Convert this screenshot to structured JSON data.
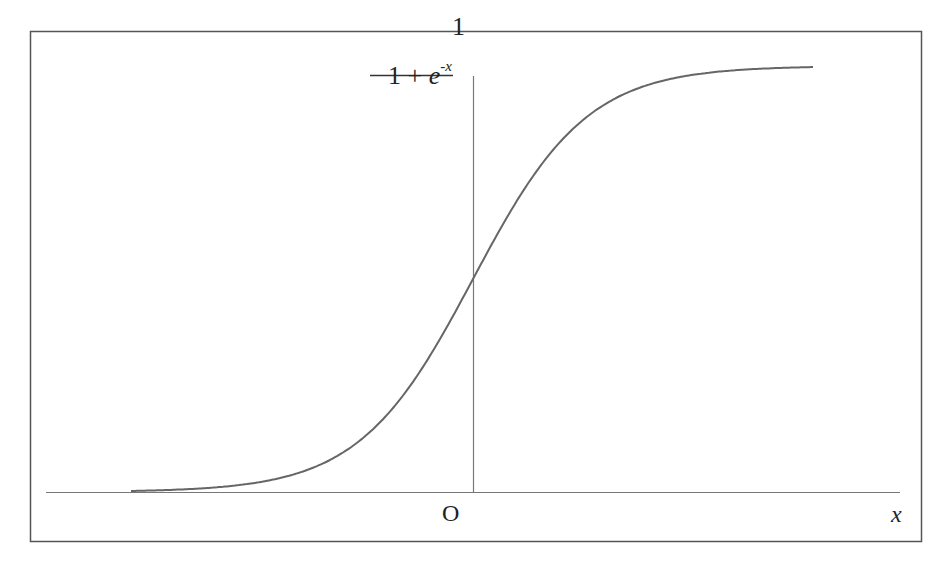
{
  "figure": {
    "frame_color": "#555555",
    "axis_color": "#777777",
    "curve_color": "#666666",
    "function_label": {
      "numerator": "1",
      "denominator_prefix": "1 + ",
      "denominator_base": "e",
      "denominator_exponent": "-x"
    },
    "origin_label": "O",
    "x_axis_label": "x"
  },
  "chart_data": {
    "type": "line",
    "title": "",
    "function": "1 / (1 + e^-x)",
    "xlabel": "x",
    "ylabel": "1 / (1 + e^-x)",
    "origin_label": "O",
    "xlim": [
      -6,
      6
    ],
    "ylim": [
      0,
      1
    ],
    "grid": false,
    "legend": null,
    "series": [
      {
        "name": "sigmoid",
        "x": [
          -6,
          -5,
          -4,
          -3,
          -2,
          -1,
          0,
          1,
          2,
          3,
          4,
          5,
          6
        ],
        "y": [
          0.0025,
          0.0067,
          0.018,
          0.047,
          0.119,
          0.269,
          0.5,
          0.731,
          0.881,
          0.953,
          0.982,
          0.993,
          0.9975
        ]
      }
    ]
  }
}
